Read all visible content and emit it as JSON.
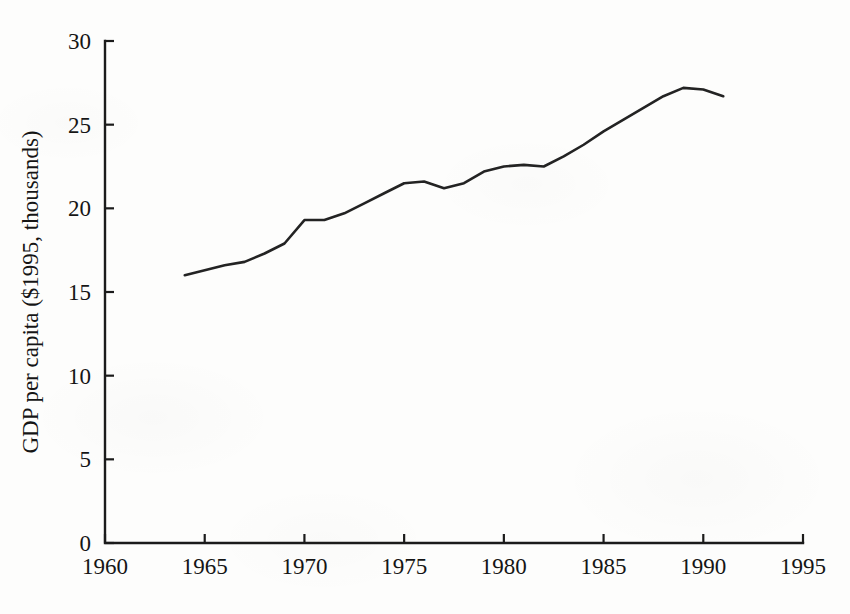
{
  "figure": {
    "background_color": "#fdfdfc",
    "line_color": "#232323",
    "axis_color": "#1b1b1b"
  },
  "chart_data": {
    "type": "line",
    "title": "",
    "subtitle": "",
    "xlabel": "",
    "ylabel": "GDP per capita ($1995, thousands)",
    "xlim": [
      1960,
      1995
    ],
    "ylim": [
      0,
      30
    ],
    "xticks": [
      1960,
      1965,
      1970,
      1975,
      1980,
      1985,
      1990,
      1995
    ],
    "xtick_labels": [
      "1960",
      "1965",
      "1970",
      "1975",
      "1980",
      "1985",
      "1990",
      "1995"
    ],
    "yticks": [
      0,
      5,
      10,
      15,
      20,
      25,
      30
    ],
    "ytick_labels": [
      "0",
      "5",
      "10",
      "15",
      "20",
      "25",
      "30"
    ],
    "grid": false,
    "legend": false,
    "legend_position": "none",
    "annotations": [],
    "x": [
      1964,
      1965,
      1966,
      1967,
      1968,
      1969,
      1970,
      1971,
      1972,
      1973,
      1974,
      1975,
      1976,
      1977,
      1978,
      1979,
      1980,
      1981,
      1982,
      1983,
      1984,
      1985,
      1986,
      1987,
      1988,
      1989,
      1990,
      1991
    ],
    "series": [
      {
        "name": "GDP per capita",
        "values": [
          16.0,
          16.3,
          16.6,
          16.8,
          17.3,
          17.9,
          19.3,
          19.3,
          19.7,
          20.3,
          20.9,
          21.5,
          21.6,
          21.2,
          21.5,
          22.2,
          22.5,
          22.6,
          22.5,
          23.1,
          23.8,
          24.6,
          25.3,
          26.0,
          26.7,
          27.2,
          27.1,
          26.7
        ]
      }
    ]
  }
}
